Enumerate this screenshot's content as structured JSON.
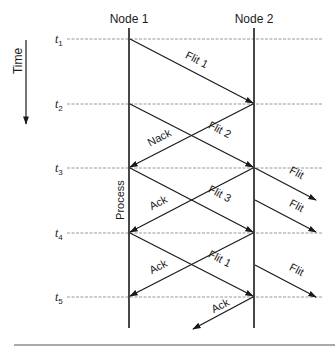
{
  "diagram": {
    "type": "sequence-timing",
    "time_axis": {
      "label": "Time",
      "direction": "down"
    },
    "nodes": [
      {
        "id": "node1",
        "label": "Node 1"
      },
      {
        "id": "node2",
        "label": "Node 2"
      }
    ],
    "time_marks": [
      {
        "letter": "t",
        "sub": "1"
      },
      {
        "letter": "t",
        "sub": "2"
      },
      {
        "letter": "t",
        "sub": "3"
      },
      {
        "letter": "t",
        "sub": "4"
      },
      {
        "letter": "t",
        "sub": "5"
      }
    ],
    "messages": [
      {
        "label": "Flit 1",
        "from": "Node 1",
        "to": "Node 2",
        "start": "t1",
        "end": "t2"
      },
      {
        "label": "Flit 2",
        "from": "Node 1",
        "to": "Node 2",
        "start": "t2",
        "end": "t3"
      },
      {
        "label": "Nack",
        "from": "Node 2",
        "to": "Node 1",
        "start": "t2",
        "end": "t3"
      },
      {
        "label": "Flit",
        "from": "Node 2",
        "to": "next",
        "start": "t3",
        "end": ""
      },
      {
        "label": "Flit 3",
        "from": "Node 1",
        "to": "Node 2",
        "start": "t3",
        "end": "t4"
      },
      {
        "label": "Ack",
        "from": "Node 2",
        "to": "Node 1",
        "start": "t3",
        "end": "t4"
      },
      {
        "label": "Flit",
        "from": "Node 2",
        "to": "next",
        "start": "",
        "end": "t4"
      },
      {
        "label": "Flit 1",
        "from": "Node 1",
        "to": "Node 2",
        "start": "t4",
        "end": "t5"
      },
      {
        "label": "Ack",
        "from": "Node 2",
        "to": "Node 1",
        "start": "t4",
        "end": "t5"
      },
      {
        "label": "Flit",
        "from": "Node 2",
        "to": "next",
        "start": "",
        "end": "t5"
      },
      {
        "label": "Ack",
        "from": "Node 2",
        "to": "previous",
        "start": "t5",
        "end": ""
      }
    ],
    "annotations": [
      {
        "label": "Process",
        "node": "Node 1",
        "span": "t3-t4"
      }
    ],
    "colors": {
      "line": "#1a1a1a",
      "dashed": "#9a9a9a",
      "background": "#ffffff"
    }
  }
}
